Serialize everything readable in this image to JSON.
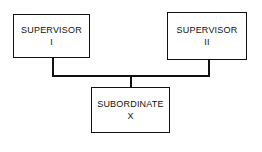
{
  "diagram": {
    "nodes": [
      {
        "id": "sup1",
        "title": "SUPERVISOR",
        "sub": "I"
      },
      {
        "id": "sup2",
        "title": "SUPERVISOR",
        "sub": "II"
      },
      {
        "id": "sub",
        "title": "SUBORDINATE",
        "sub": "X"
      }
    ],
    "edges": [
      [
        "sup1",
        "sub"
      ],
      [
        "sup2",
        "sub"
      ]
    ]
  }
}
